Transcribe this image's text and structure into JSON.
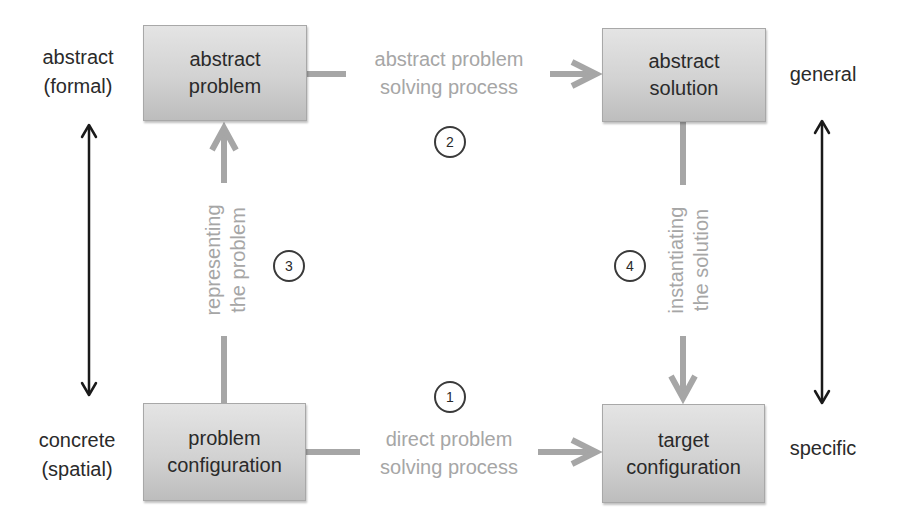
{
  "diagram": {
    "type": "problem-solving-flow",
    "colors": {
      "box_fill_top": "#e4e4e4",
      "box_fill_bottom": "#bdbdbd",
      "box_border": "#a8a8a8",
      "process_arrow": "#a6a6a6",
      "process_text": "#a6a6a6",
      "axis_arrow": "#1a1a1a",
      "text": "#2a2a2a"
    },
    "left_axis": {
      "top_label": [
        "abstract",
        "(formal)"
      ],
      "bottom_label": [
        "concrete",
        "(spatial)"
      ]
    },
    "right_axis": {
      "top_label": "general",
      "bottom_label": "specific"
    },
    "nodes": {
      "abstract_problem": {
        "lines": [
          "abstract",
          "problem"
        ]
      },
      "abstract_solution": {
        "lines": [
          "abstract",
          "solution"
        ]
      },
      "problem_configuration": {
        "lines": [
          "problem",
          "configuration"
        ]
      },
      "target_configuration": {
        "lines": [
          "target",
          "configuration"
        ]
      }
    },
    "edges": {
      "direct": {
        "step": "1",
        "lines": [
          "direct problem",
          "solving process"
        ],
        "from": "problem configuration",
        "to": "target configuration"
      },
      "abstract": {
        "step": "2",
        "lines": [
          "abstract problem",
          "solving process"
        ],
        "from": "abstract problem",
        "to": "abstract solution"
      },
      "representing": {
        "step": "3",
        "lines": [
          "representing",
          "the problem"
        ],
        "from": "problem configuration",
        "to": "abstract problem"
      },
      "instantiating": {
        "step": "4",
        "lines": [
          "instantiating",
          "the solution"
        ],
        "from": "abstract solution",
        "to": "target configuration"
      }
    }
  }
}
